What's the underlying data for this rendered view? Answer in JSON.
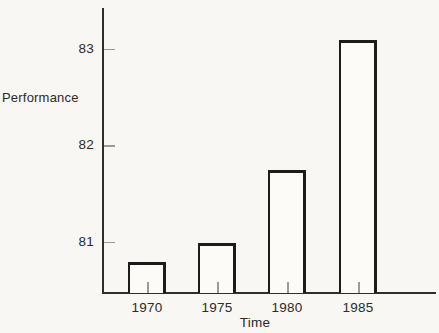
{
  "chart_data": {
    "type": "bar",
    "title": "",
    "categories": [
      "1970",
      "1975",
      "1980",
      "1985"
    ],
    "values": [
      80.8,
      81.0,
      81.75,
      83.1
    ],
    "xlabel": "Time",
    "ylabel": "Performance",
    "yticks": [
      81,
      82,
      83
    ],
    "ylim": [
      80.48,
      83.43
    ],
    "grid": false,
    "legend": false,
    "bar_fill": "#fcfbf8",
    "bar_border": "#1c1c1c",
    "axis_color": "#2e2e2e",
    "tick_color": "#9a9a9a",
    "text_color": "#2b2b2b",
    "background": "#f8f7f3"
  }
}
